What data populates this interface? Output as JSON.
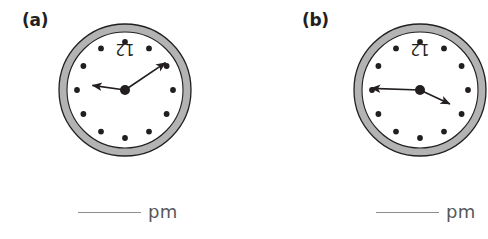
{
  "page": {
    "background_color": "#ffffff",
    "width": 488,
    "height": 239
  },
  "style_colors": {
    "bezel_fill": "#b3b3b3",
    "bezel_outline": "#231f20",
    "face_fill": "#ffffff",
    "hour_dot": "#231f20",
    "hand": "#231f20",
    "text_dark": "#231f20",
    "rule_gray": "#8d8d8f",
    "pm_gray": "#58585b"
  },
  "problems": [
    {
      "id": "a",
      "label": "(a)",
      "clock": {
        "numeral_label": "12",
        "numeral_rotated_180": true,
        "hour_marks": 12,
        "hands": [
          {
            "name": "hour-hand",
            "points_to_hour": 9,
            "angle_deg": 262,
            "length": 33
          },
          {
            "name": "minute-hand",
            "points_to_hour": 2,
            "angle_deg": 56,
            "length": 49
          }
        ]
      },
      "answer": {
        "blank": "",
        "suffix": "pm"
      }
    },
    {
      "id": "b",
      "label": "(b)",
      "clock": {
        "numeral_label": "12",
        "numeral_rotated_180": true,
        "hour_marks": 12,
        "hands": [
          {
            "name": "minute-hand",
            "points_to_hour": 9,
            "angle_deg": 272,
            "length": 49
          },
          {
            "name": "hour-hand",
            "points_to_hour": 4,
            "angle_deg": 115,
            "length": 33
          }
        ]
      },
      "answer": {
        "blank": "",
        "suffix": "pm"
      }
    }
  ]
}
